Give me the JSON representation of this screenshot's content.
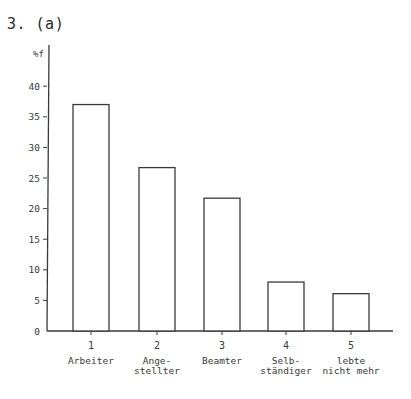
{
  "title": "3. (a)",
  "chart_data": {
    "type": "bar",
    "title": "3. (a)",
    "xlabel": "",
    "ylabel": "%f",
    "ylim": [
      0,
      42
    ],
    "yticks": [
      0,
      5,
      10,
      15,
      20,
      25,
      30,
      35,
      40
    ],
    "grid": false,
    "legend": null,
    "categories": [
      "1",
      "2",
      "3",
      "4",
      "5"
    ],
    "category_labels": [
      [
        "Arbeiter"
      ],
      [
        "Ange-",
        "stellter"
      ],
      [
        "Beamter"
      ],
      [
        "Selb-",
        "ständiger"
      ],
      [
        "lebte",
        "nicht mehr"
      ]
    ],
    "values": [
      37,
      26.7,
      21.7,
      8,
      6.1
    ]
  }
}
